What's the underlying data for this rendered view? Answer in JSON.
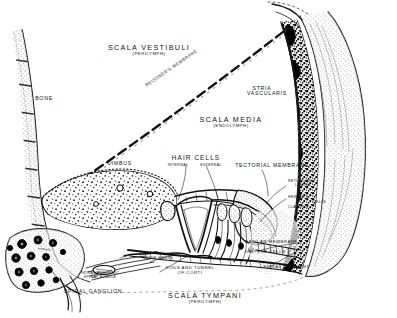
{
  "figure": {
    "background_color": "#ffffff",
    "ink_color": "#111111",
    "width": 397,
    "height": 318
  },
  "labels": {
    "scala_vestibuli": "SCALA VESTIBULI",
    "scala_vestibuli_sub": "(PERILYMPH)",
    "bone": "BONE",
    "reissners_membrane": "REISSNER'S MEMBRANE",
    "stria_vascularis_1": "STRIA",
    "stria_vascularis_2": "VASCULARIS",
    "scala_media": "SCALA MEDIA",
    "scala_media_sub": "(ENDOLYMPH)",
    "limbus": "LIMBUS",
    "hair_cells": "HAIR CELLS",
    "hair_cells_internal": "INTERNAL",
    "hair_cells_external": "EXTERNAL",
    "tectorial_membrane": "TECTORIAL MEMBRANE",
    "reticular_lamina_1": "RETICULAR",
    "reticular_lamina_2": "LAMINA",
    "hensens": "HENSEN'S",
    "claudius": "CLAUDIUS",
    "cells": "CELLS",
    "basilar_membrane": "BASILAR MEMBRANE",
    "deiters_cells": "DEITERS CELLS",
    "spiral_ligament": "SPIRAL LIGAMENT",
    "nerve_fibers": "NERVE FIBERS",
    "rods_and_tunnel": "RODS AND TUNNEL",
    "of_corti": "OF CORTI",
    "intraganglionic_1": "INTRAGANGLIONIC",
    "intraganglionic_2": "SPIRAL BUNDLE",
    "spiral_ganglion": "SPIRAL GANGLION",
    "scala_tympani": "SCALA TYMPANI",
    "scala_tympani_sub": "(PERILYMPH)"
  }
}
